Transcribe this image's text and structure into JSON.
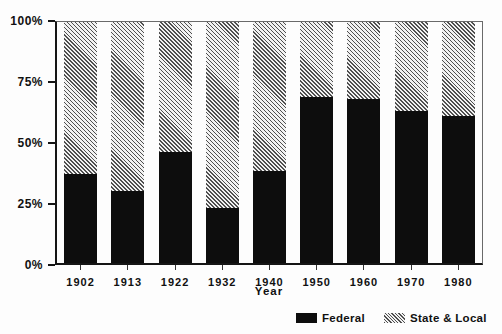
{
  "figure": {
    "background": "#fdfdfd"
  },
  "colors": {
    "federal_fill": "#0d0d0d",
    "hatch_line": "#4f4f4f",
    "hatch_background": "#f2f2f2",
    "axis_line": "#151515",
    "frame_line": "#6a6a6a",
    "text": "#111111"
  },
  "chart_data": {
    "type": "bar",
    "subtype": "100-percent-stacked-vertical",
    "title": "",
    "xlabel": "Year",
    "ylabel": "",
    "categories": [
      "1902",
      "1913",
      "1922",
      "1932",
      "1940",
      "1950",
      "1960",
      "1970",
      "1980"
    ],
    "series": [
      {
        "name": "Federal",
        "fill": "solid-black",
        "values": [
          37,
          30,
          46,
          23,
          38,
          69,
          68,
          63,
          61
        ]
      },
      {
        "name": "State & Local",
        "fill": "diagonal-hatch",
        "values": [
          63,
          70,
          54,
          77,
          62,
          31,
          32,
          37,
          39
        ]
      }
    ],
    "units": "percent",
    "ylim": [
      0,
      100
    ],
    "y_ticks": [
      "100%",
      "75%",
      "50%",
      "25%",
      "0%"
    ],
    "grid": "off",
    "legend_position": "bottom-right"
  }
}
